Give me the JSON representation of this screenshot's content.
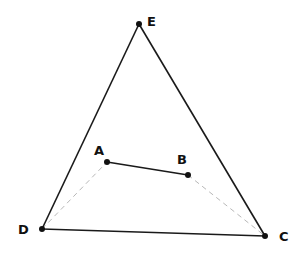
{
  "diagram": {
    "points": {
      "E": {
        "label": "E",
        "x": 139,
        "y": 24,
        "lx": 147,
        "ly": 26
      },
      "A": {
        "label": "A",
        "x": 107,
        "y": 162,
        "lx": 94,
        "ly": 155
      },
      "B": {
        "label": "B",
        "x": 188,
        "y": 175,
        "lx": 177,
        "ly": 164
      },
      "D": {
        "label": "D",
        "x": 42,
        "y": 229,
        "lx": 18,
        "ly": 234
      },
      "C": {
        "label": "C",
        "x": 265,
        "y": 236,
        "lx": 279,
        "ly": 241
      }
    },
    "solid_segments": [
      "DE",
      "EC",
      "DC",
      "AB"
    ],
    "dashed_segments": [
      "DA",
      "BC"
    ],
    "colors": {
      "line": "#1a1a1a",
      "dashed": "#b8b8b8",
      "point": "#111111"
    }
  }
}
